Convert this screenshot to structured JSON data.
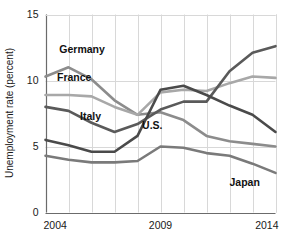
{
  "chart_data": {
    "type": "line",
    "title": "",
    "subtitle": "",
    "xlabel": "",
    "ylabel": "Unemployment rate (percent)",
    "xlim": [
      2004,
      2014
    ],
    "ylim": [
      0,
      15
    ],
    "yticks": [
      "0",
      "5",
      "10",
      "15"
    ],
    "ytick_values": [
      0,
      5,
      10,
      15
    ],
    "xticks": [
      "2004",
      "2009",
      "2014"
    ],
    "xtick_values": [
      2004,
      2009,
      2014
    ],
    "grid": "vertical-and-horizontal",
    "legend": "inline-labels",
    "x": [
      2004,
      2005,
      2006,
      2007,
      2008,
      2009,
      2010,
      2011,
      2012,
      2013,
      2014
    ],
    "series": [
      {
        "name": "Germany",
        "color": "#8c8c8c",
        "label": "Germany",
        "values": [
          10.3,
          11.0,
          10.1,
          8.5,
          7.4,
          7.6,
          7.0,
          5.8,
          5.4,
          5.2,
          5.0
        ]
      },
      {
        "name": "France",
        "color": "#a8a8a8",
        "label": "France",
        "values": [
          8.9,
          8.9,
          8.8,
          8.0,
          7.4,
          9.1,
          9.3,
          9.2,
          9.8,
          10.3,
          10.2
        ]
      },
      {
        "name": "Italy",
        "color": "#5a5a5a",
        "label": "Italy",
        "values": [
          8.0,
          7.7,
          6.8,
          6.1,
          6.7,
          7.8,
          8.4,
          8.4,
          10.7,
          12.1,
          12.6
        ]
      },
      {
        "name": "U.S.",
        "color": "#4a4a4a",
        "label": "U.S.",
        "values": [
          5.5,
          5.1,
          4.6,
          4.6,
          5.8,
          9.3,
          9.6,
          8.9,
          8.1,
          7.4,
          6.1
        ]
      },
      {
        "name": "Japan",
        "color": "#7a7a7a",
        "label": "Japan",
        "values": [
          4.3,
          4.0,
          3.8,
          3.8,
          3.9,
          5.0,
          4.9,
          4.5,
          4.3,
          3.7,
          3.0
        ]
      }
    ],
    "annotations": [
      {
        "text": "Germany",
        "x": 2004.6,
        "y": 12.1
      },
      {
        "text": "France",
        "x": 2004.5,
        "y": 10.0
      },
      {
        "text": "Italy",
        "x": 2005.5,
        "y": 7.0
      },
      {
        "text": "U.S.",
        "x": 2008.2,
        "y": 6.3
      },
      {
        "text": "Japan",
        "x": 2012.0,
        "y": 2.0
      }
    ],
    "colors": {
      "germany": "#8c8c8c",
      "france": "#a8a8a8",
      "italy": "#5a5a5a",
      "us": "#4a4a4a",
      "japan": "#7a7a7a",
      "grid": "#d8d8d8",
      "axis": "#6b6b6b",
      "text": "#1a1a1a",
      "background": "#ffffff"
    }
  }
}
